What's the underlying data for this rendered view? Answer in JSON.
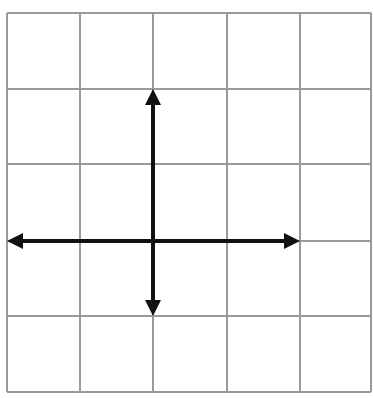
{
  "diagram": {
    "type": "coordinate-grid-with-arrows",
    "grid": {
      "columns": 5,
      "rows": 5,
      "x_lines": [
        7,
        80,
        153,
        227,
        300,
        371
      ],
      "y_lines": [
        13,
        89,
        164,
        241,
        316,
        392
      ],
      "line_color": "#9a9a9a"
    },
    "origin": {
      "x": 153,
      "y": 241
    },
    "arrows": [
      {
        "name": "arrow-up",
        "tip": [
          153,
          89
        ],
        "direction": "up"
      },
      {
        "name": "arrow-down",
        "tip": [
          153,
          316
        ],
        "direction": "down"
      },
      {
        "name": "arrow-left",
        "tip": [
          7,
          241
        ],
        "direction": "left"
      },
      {
        "name": "arrow-right",
        "tip": [
          300,
          241
        ],
        "direction": "right"
      }
    ],
    "arrow_color": "#111111"
  }
}
